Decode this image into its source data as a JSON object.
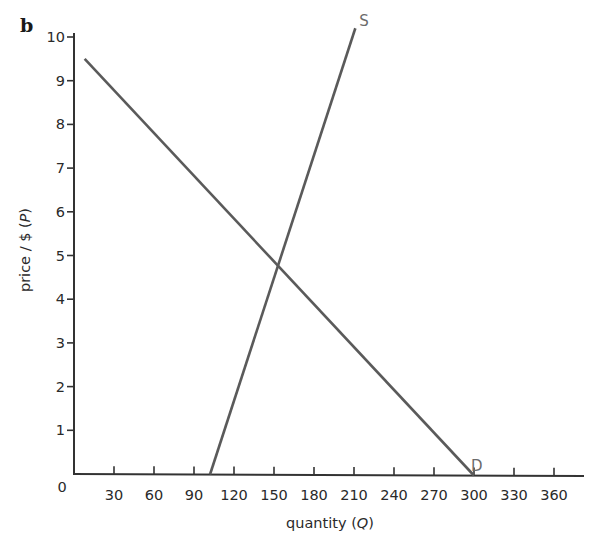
{
  "panel_label": "b",
  "chart_data": {
    "type": "line",
    "title": "",
    "xlabel": "quantity (Q)",
    "ylabel": "price / $ (P)",
    "xlim": [
      0,
      380
    ],
    "ylim": [
      0,
      10.3
    ],
    "x_ticks": [
      30,
      60,
      90,
      120,
      150,
      180,
      210,
      240,
      270,
      300,
      330,
      360
    ],
    "y_ticks": [
      1,
      2,
      3,
      4,
      5,
      6,
      7,
      8,
      9,
      10
    ],
    "origin_label": "0",
    "grid": false,
    "legend": "none",
    "series": [
      {
        "name": "S",
        "label": "S",
        "description": "Supply curve",
        "points": [
          [
            102,
            0
          ],
          [
            211,
            10.2
          ]
        ],
        "color": "#5a5a5a"
      },
      {
        "name": "D",
        "label": "D",
        "description": "Demand curve",
        "points": [
          [
            8,
            9.5
          ],
          [
            300,
            0
          ]
        ],
        "color": "#5a5a5a"
      }
    ],
    "equilibrium": {
      "Q": 154,
      "P": 4.8
    }
  },
  "axes": {
    "x_title_main": "quantity (",
    "x_title_var": "Q",
    "x_title_end": ")",
    "y_title_main": "price / $ (",
    "y_title_var": "P",
    "y_title_end": ")"
  }
}
